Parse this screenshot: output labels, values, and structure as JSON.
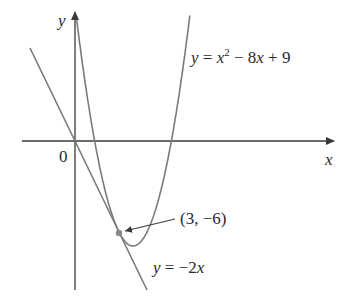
{
  "chart_data": {
    "type": "line",
    "title": "",
    "xlabel": "x",
    "ylabel": "y",
    "origin_label": "0",
    "grid": false,
    "series": [
      {
        "name": "y = x^2 - 8x + 9",
        "function": "x^2 - 8x + 9",
        "kind": "parabola"
      },
      {
        "name": "y = -2x",
        "function": "-2x",
        "kind": "tangent line"
      }
    ],
    "annotations": [
      {
        "label": "(3, -6)",
        "point": [
          3,
          -6
        ],
        "note": "point of tangency"
      }
    ],
    "xlim": [
      -3.1,
      10.5
    ],
    "ylim": [
      -9.8,
      8.6
    ]
  },
  "labels": {
    "y_axis": "y",
    "x_axis": "x",
    "origin": "0",
    "parabola_eq": {
      "y": "y",
      "eq": " = ",
      "x": "x",
      "sup": "2",
      "rest1": " − 8",
      "x2": "x",
      "rest2": " + 9"
    },
    "line_eq": {
      "y": "y",
      "eq": " = −2",
      "x": "x"
    },
    "point": "(3, −6)"
  },
  "colors": {
    "curve": "#7a7a7a",
    "axis": "#3a3a3a",
    "text": "#2a2a2a",
    "point": "#8a8a8a"
  }
}
